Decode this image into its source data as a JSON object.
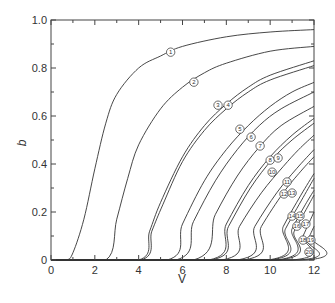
{
  "chart_data": {
    "type": "line",
    "title": "",
    "xlabel": "V",
    "ylabel": "b",
    "xlim": [
      0,
      12
    ],
    "ylim": [
      0,
      1.0
    ],
    "x_ticks": [
      "0",
      "2",
      "4",
      "6",
      "8",
      "10",
      "12"
    ],
    "y_ticks": [
      "0",
      "0.2",
      "0.4",
      "0.6",
      "0.8",
      "1.0"
    ],
    "grid": false,
    "legend": "none; curves labeled with small circled numbers",
    "series": [
      {
        "name": "1",
        "onset": 0.7,
        "points": [
          [
            0.7,
            0
          ],
          [
            1.0,
            0.03
          ],
          [
            1.5,
            0.17
          ],
          [
            2.0,
            0.38
          ],
          [
            2.5,
            0.57
          ],
          [
            3.0,
            0.69
          ],
          [
            4.0,
            0.8
          ],
          [
            5.0,
            0.85
          ],
          [
            6.0,
            0.89
          ],
          [
            8.0,
            0.93
          ],
          [
            10.0,
            0.95
          ],
          [
            12.0,
            0.96
          ]
        ]
      },
      {
        "name": "2",
        "onset": 2.5,
        "points": [
          [
            2.5,
            0
          ],
          [
            3.0,
            0.17
          ],
          [
            3.5,
            0.34
          ],
          [
            4.0,
            0.48
          ],
          [
            5.0,
            0.63
          ],
          [
            6.0,
            0.72
          ],
          [
            7.0,
            0.78
          ],
          [
            8.0,
            0.82
          ],
          [
            10.0,
            0.87
          ],
          [
            12.0,
            0.89
          ]
        ]
      },
      {
        "name": "3",
        "onset": 4.0,
        "points": [
          [
            4.0,
            0
          ],
          [
            4.5,
            0.12
          ],
          [
            5.0,
            0.24
          ],
          [
            6.0,
            0.43
          ],
          [
            7.0,
            0.56
          ],
          [
            8.0,
            0.65
          ],
          [
            9.0,
            0.72
          ],
          [
            10.0,
            0.77
          ],
          [
            12.0,
            0.83
          ]
        ]
      },
      {
        "name": "4",
        "onset": 4.1,
        "points": [
          [
            4.1,
            0
          ],
          [
            4.6,
            0.12
          ],
          [
            5.1,
            0.23
          ],
          [
            6.0,
            0.41
          ],
          [
            7.0,
            0.54
          ],
          [
            8.0,
            0.63
          ],
          [
            9.0,
            0.7
          ],
          [
            10.0,
            0.75
          ],
          [
            12.0,
            0.81
          ]
        ]
      },
      {
        "name": "5",
        "onset": 5.3,
        "points": [
          [
            5.3,
            0
          ],
          [
            6.0,
            0.15
          ],
          [
            7.0,
            0.33
          ],
          [
            8.0,
            0.46
          ],
          [
            9.0,
            0.56
          ],
          [
            10.0,
            0.64
          ],
          [
            11.0,
            0.7
          ],
          [
            12.0,
            0.74
          ]
        ]
      },
      {
        "name": "6",
        "onset": 5.7,
        "points": [
          [
            5.7,
            0
          ],
          [
            6.5,
            0.16
          ],
          [
            7.5,
            0.33
          ],
          [
            8.5,
            0.46
          ],
          [
            9.5,
            0.56
          ],
          [
            10.5,
            0.63
          ],
          [
            12.0,
            0.7
          ]
        ]
      },
      {
        "name": "7",
        "onset": 6.5,
        "points": [
          [
            6.5,
            0
          ],
          [
            7.5,
            0.19
          ],
          [
            8.5,
            0.35
          ],
          [
            9.5,
            0.47
          ],
          [
            10.5,
            0.56
          ],
          [
            12.0,
            0.64
          ]
        ]
      },
      {
        "name": "8",
        "onset": 7.2,
        "points": [
          [
            7.2,
            0
          ],
          [
            8.0,
            0.15
          ],
          [
            9.0,
            0.31
          ],
          [
            10.0,
            0.43
          ],
          [
            11.0,
            0.52
          ],
          [
            12.0,
            0.59
          ]
        ]
      },
      {
        "name": "9",
        "onset": 7.3,
        "points": [
          [
            7.3,
            0
          ],
          [
            8.1,
            0.14
          ],
          [
            9.1,
            0.3
          ],
          [
            10.1,
            0.42
          ],
          [
            11.0,
            0.5
          ],
          [
            12.0,
            0.57
          ]
        ]
      },
      {
        "name": "10",
        "onset": 7.8,
        "points": [
          [
            7.8,
            0
          ],
          [
            8.6,
            0.14
          ],
          [
            9.6,
            0.28
          ],
          [
            10.6,
            0.39
          ],
          [
            11.3,
            0.46
          ],
          [
            12.0,
            0.52
          ]
        ]
      },
      {
        "name": "11",
        "onset": 8.5,
        "points": [
          [
            8.5,
            0
          ],
          [
            9.3,
            0.14
          ],
          [
            10.3,
            0.28
          ],
          [
            11.2,
            0.38
          ],
          [
            12.0,
            0.46
          ]
        ]
      },
      {
        "name": "12",
        "onset": 8.8,
        "points": [
          [
            8.8,
            0
          ],
          [
            9.6,
            0.14
          ],
          [
            10.6,
            0.28
          ],
          [
            11.4,
            0.37
          ],
          [
            12.0,
            0.43
          ]
        ]
      },
      {
        "name": "13",
        "onset": 9.9,
        "points": [
          [
            9.9,
            0
          ],
          [
            10.6,
            0.14
          ],
          [
            11.4,
            0.27
          ],
          [
            12.0,
            0.36
          ]
        ]
      },
      {
        "name": "14",
        "onset": 10.0,
        "points": [
          [
            10.0,
            0
          ],
          [
            10.7,
            0.13
          ],
          [
            11.5,
            0.26
          ],
          [
            12.0,
            0.34
          ]
        ]
      },
      {
        "name": "15",
        "onset": 10.3,
        "points": [
          [
            10.3,
            0
          ],
          [
            11.0,
            0.13
          ],
          [
            11.6,
            0.23
          ],
          [
            12.0,
            0.29
          ]
        ]
      },
      {
        "name": "16",
        "onset": 10.4,
        "points": [
          [
            10.4,
            0
          ],
          [
            11.1,
            0.12
          ],
          [
            11.7,
            0.22
          ],
          [
            12.0,
            0.27
          ]
        ]
      },
      {
        "name": "17",
        "onset": 11.0,
        "points": [
          [
            11.0,
            0
          ],
          [
            11.5,
            0.1
          ],
          [
            12.0,
            0.2
          ]
        ]
      },
      {
        "name": "18",
        "onset": 11.3,
        "points": [
          [
            11.3,
            0
          ],
          [
            11.7,
            0.08
          ],
          [
            12.0,
            0.14
          ]
        ]
      },
      {
        "name": "19",
        "onset": 11.6,
        "points": [
          [
            11.6,
            0
          ],
          [
            12.0,
            0.08
          ]
        ]
      }
    ],
    "markers": [
      {
        "label": "1",
        "x": 5.46,
        "y": 0.866
      },
      {
        "label": "2",
        "x": 6.52,
        "y": 0.741
      },
      {
        "label": "3",
        "x": 7.62,
        "y": 0.645
      },
      {
        "label": "4",
        "x": 8.08,
        "y": 0.645
      },
      {
        "label": "5",
        "x": 8.62,
        "y": 0.545
      },
      {
        "label": "6",
        "x": 9.13,
        "y": 0.512
      },
      {
        "label": "7",
        "x": 9.54,
        "y": 0.475
      },
      {
        "label": "8",
        "x": 10.0,
        "y": 0.416
      },
      {
        "label": "9",
        "x": 10.36,
        "y": 0.425
      },
      {
        "label": "10",
        "x": 10.09,
        "y": 0.366
      },
      {
        "label": "11",
        "x": 10.77,
        "y": 0.325
      },
      {
        "label": "12",
        "x": 10.63,
        "y": 0.275
      },
      {
        "label": "13",
        "x": 11.0,
        "y": 0.279
      },
      {
        "label": "14",
        "x": 11.0,
        "y": 0.183
      },
      {
        "label": "15",
        "x": 11.36,
        "y": 0.183
      },
      {
        "label": "16",
        "x": 11.22,
        "y": 0.141
      },
      {
        "label": "17",
        "x": 11.63,
        "y": 0.15
      },
      {
        "label": "18",
        "x": 11.5,
        "y": 0.083
      },
      {
        "label": "19",
        "x": 11.86,
        "y": 0.083
      },
      {
        "label": "20",
        "x": 11.77,
        "y": 0.033
      }
    ]
  }
}
